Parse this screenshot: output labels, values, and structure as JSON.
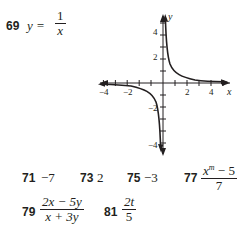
{
  "problem69": {
    "number": "69",
    "lhs": "y =",
    "numerator": "1",
    "denominator": "x"
  },
  "graph": {
    "x_axis_label": "x",
    "y_axis_label": "y",
    "x_tick_labels": [
      "−4",
      "−2",
      "2",
      "4"
    ],
    "y_tick_labels": [
      "4",
      "2",
      "−2",
      "−4"
    ],
    "function": "y = 1/x"
  },
  "answers": [
    {
      "number": "71",
      "value": "−7"
    },
    {
      "number": "73",
      "value": "2"
    },
    {
      "number": "75",
      "value": "−3"
    },
    {
      "number": "77",
      "numerator": "x",
      "numerator_sup": "m",
      "numerator_rest": " − 5",
      "denominator": "7"
    },
    {
      "number": "79",
      "numerator": "2x − 5y",
      "denominator": "x + 3y"
    },
    {
      "number": "81",
      "numerator": "2t",
      "denominator": "5"
    }
  ]
}
